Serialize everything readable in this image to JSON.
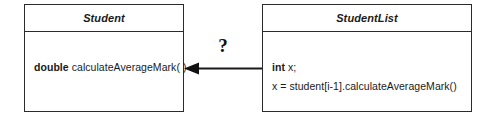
{
  "diagram": {
    "type": "uml-class-diagram",
    "background_color": "#ffffff",
    "stroke_color": "#2b2b2b",
    "text_color": "#1a1a1a"
  },
  "classes": [
    {
      "id": "student",
      "name": "Student",
      "members": [
        {
          "keyword": "double",
          "text": "calculateAverageMark( )"
        }
      ]
    },
    {
      "id": "studentlist",
      "name": "StudentList",
      "members": [
        {
          "keyword": "int",
          "text": "x;"
        },
        {
          "keyword": "",
          "text": "x = student[i-1].calculateAverageMark()"
        }
      ]
    }
  ],
  "connector": {
    "label": "?",
    "direction": "left",
    "arrowhead": "solid-filled",
    "from": "StudentList",
    "to": "Student"
  }
}
